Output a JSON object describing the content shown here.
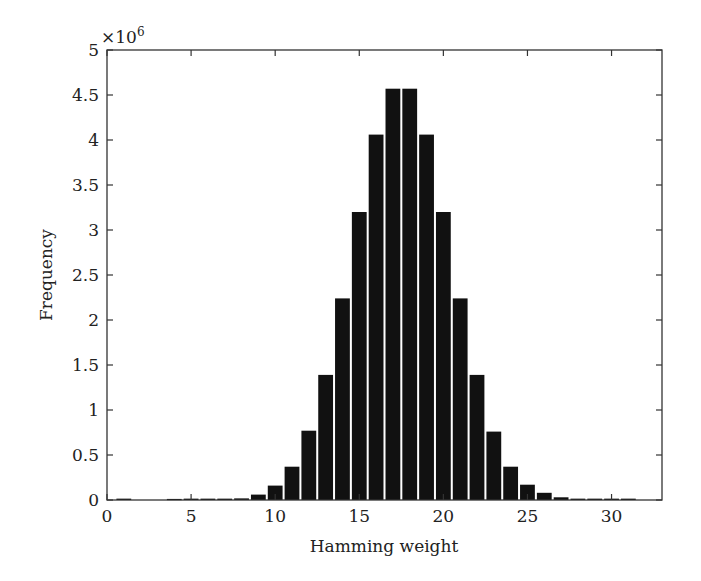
{
  "chart_data": {
    "type": "bar",
    "title": "",
    "xlabel": "Hamming weight",
    "ylabel": "Frequency",
    "y_multiplier_label": "×10",
    "y_multiplier_exponent": "6",
    "xlim": [
      0,
      33
    ],
    "ylim": [
      0,
      5
    ],
    "y_scale": 1000000,
    "grid": false,
    "legend": null,
    "bar_color": "#111111",
    "x_ticks": [
      0,
      5,
      10,
      15,
      20,
      25,
      30
    ],
    "y_ticks": [
      0,
      0.5,
      1,
      1.5,
      2,
      2.5,
      3,
      3.5,
      4,
      4.5,
      5
    ],
    "y_tick_labels": [
      "0",
      "0.5",
      "1",
      "1.5",
      "2",
      "2.5",
      "3",
      "3.5",
      "4",
      "4.5",
      "5"
    ],
    "categories": [
      1,
      4,
      5,
      6,
      7,
      8,
      9,
      10,
      11,
      12,
      13,
      14,
      15,
      16,
      17,
      18,
      19,
      20,
      21,
      22,
      23,
      24,
      25,
      26,
      27,
      28,
      29,
      30,
      31
    ],
    "values": [
      0.015,
      0.012,
      0.015,
      0.015,
      0.015,
      0.018,
      0.06,
      0.16,
      0.37,
      0.77,
      1.39,
      2.24,
      3.2,
      4.06,
      4.57,
      4.57,
      4.06,
      3.2,
      2.24,
      1.39,
      0.76,
      0.37,
      0.17,
      0.08,
      0.03,
      0.015,
      0.015,
      0.015,
      0.015
    ]
  }
}
